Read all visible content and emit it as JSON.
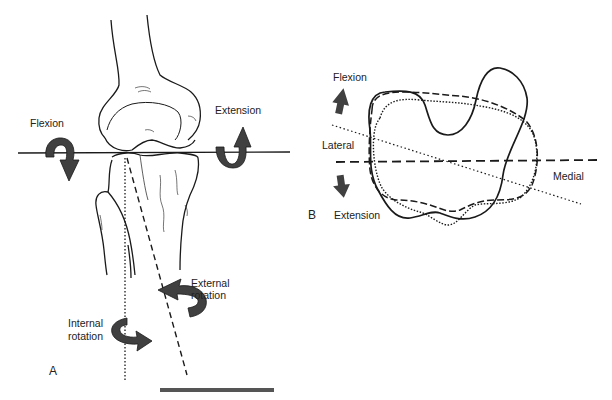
{
  "panel_a": {
    "letter": "A",
    "labels": {
      "flexion": "Flexion",
      "extension": "Extension",
      "external_rotation_line1": "External",
      "external_rotation_line2": "rotation",
      "internal_rotation_line1": "Internal",
      "internal_rotation_line2": "rotation"
    },
    "arrow_color": "#404040",
    "scale_bar_color": "#555555"
  },
  "panel_b": {
    "letter": "B",
    "labels": {
      "flexion": "Flexion",
      "extension": "Extension",
      "lateral": "Lateral",
      "medial": "Medial"
    },
    "arrow_color": "#404040",
    "contours": [
      {
        "style": "solid",
        "name": "contour-solid"
      },
      {
        "style": "dashed",
        "name": "contour-dashed"
      },
      {
        "style": "dotted",
        "name": "contour-dotted"
      }
    ]
  }
}
